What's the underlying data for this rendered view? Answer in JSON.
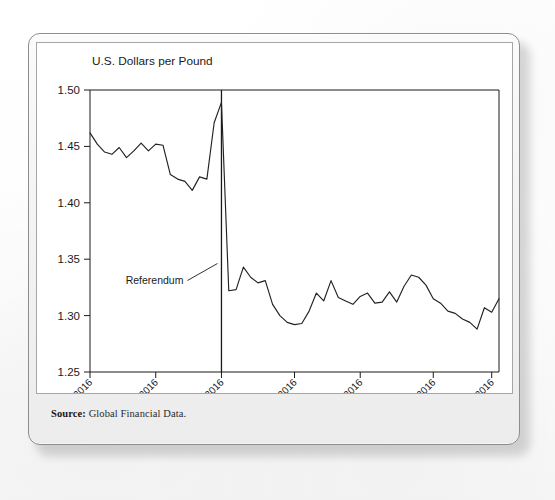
{
  "figure": {
    "source_label": "Source:",
    "source_value": "Global Financial Data."
  },
  "chart_data": {
    "type": "line",
    "title": "U.S. Dollars per Pound",
    "xlabel": "",
    "ylabel": "U.S. Dollars per Pound",
    "ylim": [
      1.25,
      1.5
    ],
    "ytick_labels": [
      "1.50",
      "1.45",
      "1.40",
      "1.35",
      "1.30",
      "1.25"
    ],
    "ytick_values": [
      1.5,
      1.45,
      1.4,
      1.35,
      1.3,
      1.25
    ],
    "xtick_labels": [
      "05/30/2016",
      "06/10/2016",
      "06/23/2016",
      "07/06/2016",
      "07/19/2016",
      "08/01/2016",
      "08/12/2016"
    ],
    "xtick_indices": [
      0,
      9,
      18,
      28,
      37,
      47,
      55
    ],
    "grid": false,
    "legend": null,
    "line_color": "#222222",
    "annotations": [
      {
        "text": "Referendum",
        "x_index": 18,
        "note": "vertical rule at 06/23/2016 referendum date with leader line to label at left"
      }
    ],
    "x": [
      "05/30/2016",
      "05/31/2016",
      "06/01/2016",
      "06/02/2016",
      "06/03/2016",
      "06/06/2016",
      "06/07/2016",
      "06/08/2016",
      "06/09/2016",
      "06/10/2016",
      "06/13/2016",
      "06/14/2016",
      "06/15/2016",
      "06/16/2016",
      "06/17/2016",
      "06/20/2016",
      "06/21/2016",
      "06/22/2016",
      "06/23/2016",
      "06/24/2016",
      "06/27/2016",
      "06/28/2016",
      "06/29/2016",
      "06/30/2016",
      "07/01/2016",
      "07/04/2016",
      "07/05/2016",
      "07/06/2016",
      "07/07/2016",
      "07/08/2016",
      "07/11/2016",
      "07/12/2016",
      "07/13/2016",
      "07/14/2016",
      "07/15/2016",
      "07/18/2016",
      "07/19/2016",
      "07/20/2016",
      "07/21/2016",
      "07/22/2016",
      "07/25/2016",
      "07/26/2016",
      "07/27/2016",
      "07/28/2016",
      "07/29/2016",
      "08/01/2016",
      "08/02/2016",
      "08/03/2016",
      "08/04/2016",
      "08/05/2016",
      "08/08/2016",
      "08/09/2016",
      "08/10/2016",
      "08/11/2016",
      "08/12/2016",
      "08/15/2016",
      "08/16/2016"
    ],
    "values": [
      1.462,
      1.452,
      1.445,
      1.443,
      1.449,
      1.44,
      1.446,
      1.453,
      1.446,
      1.452,
      1.451,
      1.425,
      1.421,
      1.419,
      1.411,
      1.423,
      1.421,
      1.471,
      1.489,
      1.322,
      1.323,
      1.343,
      1.334,
      1.329,
      1.331,
      1.31,
      1.3,
      1.294,
      1.292,
      1.293,
      1.304,
      1.32,
      1.313,
      1.331,
      1.316,
      1.313,
      1.31,
      1.317,
      1.32,
      1.311,
      1.312,
      1.321,
      1.312,
      1.326,
      1.336,
      1.334,
      1.327,
      1.315,
      1.311,
      1.304,
      1.302,
      1.297,
      1.294,
      1.288,
      1.307,
      1.303,
      1.315
    ]
  }
}
